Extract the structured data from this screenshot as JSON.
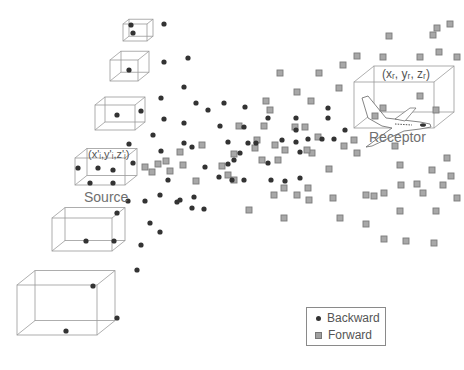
{
  "diagram": {
    "source_label": "Source",
    "source_coord": "(x'ᵢ,y'ᵢ,z'ᵢ)",
    "receptor_label": "Receptor",
    "receptor_coord": "(xᵣ, yᵣ, zᵣ)",
    "colors": {
      "backward": "#333333",
      "forward_fill": "#a8a8a8",
      "forward_stroke": "#7a7a7a",
      "box_stroke": "#9a9a9a",
      "text": "#6b6b6b"
    }
  },
  "legend": {
    "items": [
      {
        "label": "Backward",
        "marker": "dot"
      },
      {
        "label": "Forward",
        "marker": "square"
      }
    ]
  },
  "boxes": [
    {
      "x": 123,
      "y": 24,
      "w": 24,
      "h": 17,
      "d": 6
    },
    {
      "x": 110,
      "y": 60,
      "w": 28,
      "h": 21,
      "d": 11
    },
    {
      "x": 95,
      "y": 105,
      "w": 40,
      "h": 25,
      "d": 10
    },
    {
      "x": 75,
      "y": 158,
      "w": 50,
      "h": 27,
      "d": 12
    },
    {
      "x": 52,
      "y": 218,
      "w": 60,
      "h": 33,
      "d": 13
    },
    {
      "x": 17,
      "y": 285,
      "w": 80,
      "h": 50,
      "d": 18
    },
    {
      "x": 354,
      "y": 82,
      "w": 80,
      "h": 46,
      "d": 20
    }
  ],
  "backward_points": [
    [
      133,
      33
    ],
    [
      131,
      25
    ],
    [
      129,
      70
    ],
    [
      164,
      24
    ],
    [
      164,
      62
    ],
    [
      188,
      58
    ],
    [
      117,
      115
    ],
    [
      141,
      111
    ],
    [
      161,
      98
    ],
    [
      184,
      87
    ],
    [
      196,
      103
    ],
    [
      208,
      110
    ],
    [
      224,
      103
    ],
    [
      164,
      119
    ],
    [
      184,
      123
    ],
    [
      220,
      126
    ],
    [
      153,
      135
    ],
    [
      129,
      144
    ],
    [
      184,
      143
    ],
    [
      192,
      147
    ],
    [
      228,
      142
    ],
    [
      161,
      151
    ],
    [
      133,
      163
    ],
    [
      228,
      164
    ],
    [
      78,
      168
    ],
    [
      98,
      168
    ],
    [
      113,
      170
    ],
    [
      90,
      183
    ],
    [
      113,
      183
    ],
    [
      168,
      180
    ],
    [
      205,
      167
    ],
    [
      219,
      177
    ],
    [
      245,
      107
    ],
    [
      244,
      127
    ],
    [
      248,
      143
    ],
    [
      240,
      153
    ],
    [
      256,
      143
    ],
    [
      234,
      160
    ],
    [
      232,
      180
    ],
    [
      244,
      180
    ],
    [
      268,
      163
    ],
    [
      268,
      118
    ],
    [
      282,
      140
    ],
    [
      296,
      118
    ],
    [
      296,
      130
    ],
    [
      296,
      142
    ],
    [
      308,
      139
    ],
    [
      322,
      139
    ],
    [
      334,
      139
    ],
    [
      328,
      118
    ],
    [
      300,
      152
    ],
    [
      271,
      180
    ],
    [
      285,
      181
    ],
    [
      300,
      178
    ],
    [
      128,
      201
    ],
    [
      145,
      201
    ],
    [
      160,
      195
    ],
    [
      180,
      200
    ],
    [
      194,
      197
    ],
    [
      204,
      209
    ],
    [
      177,
      202
    ],
    [
      192,
      208
    ],
    [
      150,
      223
    ],
    [
      160,
      232
    ],
    [
      141,
      245
    ],
    [
      137,
      270
    ],
    [
      117,
      213
    ],
    [
      86,
      241
    ],
    [
      114,
      241
    ],
    [
      93,
      286
    ],
    [
      117,
      318
    ],
    [
      66,
      331
    ],
    [
      328,
      108
    ],
    [
      345,
      130
    ]
  ],
  "forward_points": [
    [
      450,
      24
    ],
    [
      437,
      28
    ],
    [
      433,
      35
    ],
    [
      389,
      36
    ],
    [
      439,
      52
    ],
    [
      420,
      57
    ],
    [
      457,
      57
    ],
    [
      357,
      56
    ],
    [
      383,
      57
    ],
    [
      343,
      65
    ],
    [
      319,
      73
    ],
    [
      280,
      73
    ],
    [
      297,
      92
    ],
    [
      339,
      88
    ],
    [
      420,
      96
    ],
    [
      383,
      108
    ],
    [
      436,
      110
    ],
    [
      311,
      101
    ],
    [
      375,
      116
    ],
    [
      266,
      101
    ],
    [
      239,
      126
    ],
    [
      264,
      126
    ],
    [
      295,
      127
    ],
    [
      305,
      127
    ],
    [
      255,
      148
    ],
    [
      285,
      150
    ],
    [
      312,
      153
    ],
    [
      344,
      146
    ],
    [
      307,
      150
    ],
    [
      329,
      169
    ],
    [
      357,
      153
    ],
    [
      354,
      140
    ],
    [
      395,
      146
    ],
    [
      400,
      165
    ],
    [
      447,
      158
    ],
    [
      432,
      170
    ],
    [
      451,
      176
    ],
    [
      401,
      185
    ],
    [
      417,
      184
    ],
    [
      443,
      185
    ],
    [
      384,
      193
    ],
    [
      423,
      193
    ],
    [
      457,
      198
    ],
    [
      274,
      195
    ],
    [
      284,
      188
    ],
    [
      297,
      195
    ],
    [
      309,
      200
    ],
    [
      308,
      188
    ],
    [
      249,
      210
    ],
    [
      284,
      218
    ],
    [
      340,
      218
    ],
    [
      333,
      198
    ],
    [
      366,
      195
    ],
    [
      400,
      211
    ],
    [
      436,
      211
    ],
    [
      366,
      224
    ],
    [
      384,
      239
    ],
    [
      406,
      241
    ],
    [
      434,
      243
    ],
    [
      374,
      196
    ],
    [
      166,
      161
    ],
    [
      180,
      152
    ],
    [
      152,
      172
    ],
    [
      158,
      164
    ],
    [
      170,
      171
    ],
    [
      145,
      167
    ],
    [
      183,
      165
    ],
    [
      202,
      145
    ],
    [
      222,
      166
    ],
    [
      228,
      175
    ],
    [
      257,
      140
    ],
    [
      262,
      160
    ],
    [
      234,
      180
    ],
    [
      196,
      181
    ],
    [
      234,
      154
    ],
    [
      278,
      160
    ],
    [
      270,
      110
    ],
    [
      318,
      137
    ],
    [
      275,
      145
    ]
  ]
}
